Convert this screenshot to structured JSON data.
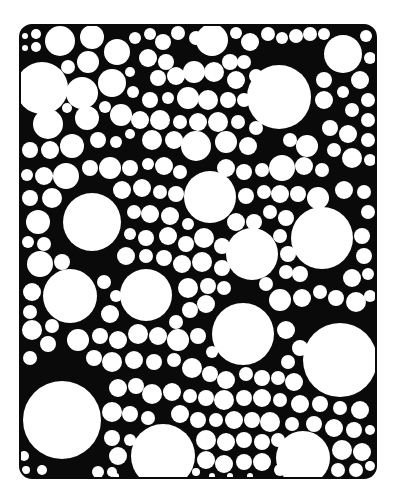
{
  "artwork": {
    "type": "circle-pattern-coloring-page",
    "frame": {
      "x": 20,
      "y": 25,
      "width": 356,
      "height": 453,
      "radius": 12
    },
    "colors": {
      "background": "#ffffff",
      "ink": "#0a0a0a",
      "fill": "#ffffff"
    },
    "circles": [
      [
        25,
        36,
        4
      ],
      [
        36,
        34,
        6
      ],
      [
        25,
        48,
        4
      ],
      [
        36,
        47,
        6
      ],
      [
        60,
        41,
        16
      ],
      [
        92,
        37,
        13
      ],
      [
        117,
        52,
        14
      ],
      [
        135,
        38,
        7
      ],
      [
        150,
        34,
        7
      ],
      [
        163,
        42,
        9
      ],
      [
        178,
        33,
        8
      ],
      [
        196,
        38,
        8
      ],
      [
        212,
        40,
        17
      ],
      [
        236,
        33,
        7
      ],
      [
        250,
        42,
        10
      ],
      [
        268,
        34,
        8
      ],
      [
        282,
        38,
        7
      ],
      [
        296,
        36,
        8
      ],
      [
        310,
        34,
        8
      ],
      [
        324,
        34,
        7
      ],
      [
        343,
        54,
        20
      ],
      [
        366,
        36,
        7
      ],
      [
        370,
        58,
        7
      ],
      [
        42,
        88,
        27
      ],
      [
        68,
        67,
        8
      ],
      [
        88,
        62,
        12
      ],
      [
        82,
        93,
        17
      ],
      [
        112,
        83,
        15
      ],
      [
        130,
        72,
        6
      ],
      [
        133,
        92,
        7
      ],
      [
        67,
        108,
        6
      ],
      [
        87,
        118,
        13
      ],
      [
        105,
        107,
        7
      ],
      [
        121,
        115,
        12
      ],
      [
        48,
        124,
        16
      ],
      [
        148,
        58,
        10
      ],
      [
        166,
        62,
        9
      ],
      [
        158,
        78,
        9
      ],
      [
        176,
        76,
        10
      ],
      [
        194,
        72,
        12
      ],
      [
        214,
        72,
        11
      ],
      [
        230,
        62,
        9
      ],
      [
        244,
        62,
        8
      ],
      [
        236,
        80,
        10
      ],
      [
        256,
        76,
        8
      ],
      [
        279,
        97,
        33
      ],
      [
        324,
        80,
        9
      ],
      [
        324,
        100,
        10
      ],
      [
        343,
        92,
        7
      ],
      [
        360,
        80,
        10
      ],
      [
        368,
        100,
        8
      ],
      [
        352,
        110,
        8
      ],
      [
        368,
        120,
        8
      ],
      [
        150,
        100,
        9
      ],
      [
        168,
        98,
        7
      ],
      [
        188,
        98,
        12
      ],
      [
        208,
        100,
        11
      ],
      [
        228,
        100,
        9
      ],
      [
        244,
        100,
        8
      ],
      [
        140,
        120,
        10
      ],
      [
        160,
        120,
        11
      ],
      [
        180,
        122,
        8
      ],
      [
        198,
        122,
        10
      ],
      [
        218,
        122,
        11
      ],
      [
        238,
        122,
        8
      ],
      [
        256,
        128,
        8
      ],
      [
        152,
        140,
        11
      ],
      [
        174,
        140,
        10
      ],
      [
        196,
        146,
        16
      ],
      [
        226,
        142,
        12
      ],
      [
        248,
        146,
        10
      ],
      [
        30,
        150,
        9
      ],
      [
        50,
        150,
        10
      ],
      [
        72,
        146,
        13
      ],
      [
        98,
        140,
        9
      ],
      [
        116,
        142,
        7
      ],
      [
        130,
        134,
        6
      ],
      [
        290,
        140,
        8
      ],
      [
        307,
        146,
        12
      ],
      [
        330,
        128,
        9
      ],
      [
        348,
        134,
        10
      ],
      [
        368,
        140,
        8
      ],
      [
        334,
        150,
        8
      ],
      [
        352,
        158,
        11
      ],
      [
        370,
        160,
        7
      ],
      [
        304,
        166,
        10
      ],
      [
        322,
        170,
        8
      ],
      [
        282,
        168,
        14
      ],
      [
        27,
        175,
        7
      ],
      [
        44,
        176,
        10
      ],
      [
        66,
        176,
        14
      ],
      [
        90,
        168,
        9
      ],
      [
        110,
        168,
        12
      ],
      [
        130,
        168,
        9
      ],
      [
        148,
        164,
        7
      ],
      [
        164,
        166,
        10
      ],
      [
        180,
        172,
        8
      ],
      [
        226,
        168,
        10
      ],
      [
        244,
        172,
        9
      ],
      [
        262,
        170,
        8
      ],
      [
        30,
        198,
        9
      ],
      [
        52,
        198,
        11
      ],
      [
        122,
        190,
        10
      ],
      [
        142,
        188,
        10
      ],
      [
        160,
        192,
        8
      ],
      [
        176,
        194,
        9
      ],
      [
        246,
        196,
        9
      ],
      [
        264,
        192,
        8
      ],
      [
        280,
        194,
        10
      ],
      [
        298,
        194,
        9
      ],
      [
        318,
        198,
        12
      ],
      [
        344,
        190,
        10
      ],
      [
        364,
        192,
        8
      ],
      [
        368,
        212,
        8
      ],
      [
        92,
        222,
        30
      ],
      [
        210,
        197,
        27
      ],
      [
        38,
        222,
        13
      ],
      [
        28,
        242,
        7
      ],
      [
        44,
        244,
        8
      ],
      [
        134,
        212,
        8
      ],
      [
        150,
        214,
        10
      ],
      [
        170,
        216,
        10
      ],
      [
        188,
        224,
        7
      ],
      [
        236,
        222,
        10
      ],
      [
        254,
        222,
        9
      ],
      [
        270,
        212,
        8
      ],
      [
        286,
        218,
        9
      ],
      [
        322,
        238,
        32
      ],
      [
        362,
        236,
        9
      ],
      [
        364,
        256,
        9
      ],
      [
        252,
        254,
        27
      ],
      [
        168,
        236,
        10
      ],
      [
        186,
        244,
        9
      ],
      [
        204,
        238,
        11
      ],
      [
        222,
        246,
        9
      ],
      [
        146,
        238,
        9
      ],
      [
        130,
        234,
        7
      ],
      [
        280,
        236,
        8
      ],
      [
        288,
        254,
        9
      ],
      [
        40,
        264,
        14
      ],
      [
        62,
        262,
        9
      ],
      [
        126,
        256,
        10
      ],
      [
        146,
        256,
        8
      ],
      [
        164,
        258,
        9
      ],
      [
        182,
        264,
        10
      ],
      [
        202,
        262,
        11
      ],
      [
        222,
        268,
        9
      ],
      [
        286,
        272,
        8
      ],
      [
        300,
        274,
        9
      ],
      [
        352,
        278,
        10
      ],
      [
        368,
        274,
        7
      ],
      [
        146,
        295,
        27
      ],
      [
        70,
        296,
        28
      ],
      [
        32,
        292,
        10
      ],
      [
        30,
        312,
        8
      ],
      [
        104,
        282,
        8
      ],
      [
        116,
        296,
        7
      ],
      [
        110,
        314,
        10
      ],
      [
        188,
        288,
        11
      ],
      [
        208,
        286,
        9
      ],
      [
        224,
        288,
        8
      ],
      [
        206,
        304,
        10
      ],
      [
        190,
        310,
        9
      ],
      [
        176,
        322,
        8
      ],
      [
        280,
        300,
        12
      ],
      [
        302,
        298,
        10
      ],
      [
        320,
        292,
        8
      ],
      [
        336,
        298,
        9
      ],
      [
        356,
        302,
        11
      ],
      [
        370,
        296,
        7
      ],
      [
        266,
        284,
        8
      ],
      [
        243,
        334,
        32
      ],
      [
        340,
        360,
        38
      ],
      [
        32,
        330,
        11
      ],
      [
        52,
        326,
        8
      ],
      [
        48,
        344,
        9
      ],
      [
        78,
        340,
        12
      ],
      [
        100,
        336,
        9
      ],
      [
        118,
        340,
        10
      ],
      [
        138,
        334,
        11
      ],
      [
        158,
        336,
        10
      ],
      [
        178,
        340,
        12
      ],
      [
        198,
        336,
        9
      ],
      [
        212,
        352,
        7
      ],
      [
        286,
        330,
        10
      ],
      [
        300,
        348,
        9
      ],
      [
        288,
        362,
        8
      ],
      [
        278,
        378,
        8
      ],
      [
        294,
        382,
        10
      ],
      [
        30,
        358,
        8
      ],
      [
        94,
        358,
        9
      ],
      [
        112,
        362,
        11
      ],
      [
        134,
        360,
        10
      ],
      [
        154,
        362,
        9
      ],
      [
        174,
        360,
        8
      ],
      [
        192,
        368,
        11
      ],
      [
        210,
        374,
        9
      ],
      [
        226,
        380,
        10
      ],
      [
        246,
        374,
        8
      ],
      [
        262,
        378,
        9
      ],
      [
        62,
        420,
        40
      ],
      [
        118,
        388,
        10
      ],
      [
        136,
        386,
        9
      ],
      [
        152,
        394,
        11
      ],
      [
        172,
        392,
        10
      ],
      [
        190,
        396,
        8
      ],
      [
        206,
        398,
        9
      ],
      [
        224,
        400,
        11
      ],
      [
        244,
        398,
        9
      ],
      [
        262,
        398,
        10
      ],
      [
        280,
        400,
        8
      ],
      [
        300,
        404,
        10
      ],
      [
        320,
        404,
        9
      ],
      [
        340,
        408,
        8
      ],
      [
        360,
        410,
        10
      ],
      [
        112,
        412,
        11
      ],
      [
        130,
        414,
        9
      ],
      [
        148,
        418,
        8
      ],
      [
        180,
        414,
        10
      ],
      [
        198,
        420,
        9
      ],
      [
        216,
        420,
        8
      ],
      [
        234,
        420,
        10
      ],
      [
        252,
        420,
        9
      ],
      [
        270,
        422,
        11
      ],
      [
        292,
        424,
        8
      ],
      [
        314,
        424,
        9
      ],
      [
        334,
        428,
        10
      ],
      [
        354,
        430,
        9
      ],
      [
        370,
        430,
        6
      ],
      [
        163,
        456,
        33
      ],
      [
        303,
        458,
        28
      ],
      [
        112,
        438,
        9
      ],
      [
        118,
        456,
        10
      ],
      [
        112,
        472,
        6
      ],
      [
        130,
        440,
        7
      ],
      [
        206,
        440,
        11
      ],
      [
        226,
        442,
        10
      ],
      [
        244,
        440,
        9
      ],
      [
        262,
        442,
        9
      ],
      [
        278,
        440,
        8
      ],
      [
        342,
        450,
        11
      ],
      [
        362,
        452,
        10
      ],
      [
        338,
        470,
        8
      ],
      [
        356,
        470,
        8
      ],
      [
        370,
        466,
        6
      ],
      [
        206,
        460,
        10
      ],
      [
        224,
        464,
        10
      ],
      [
        244,
        462,
        9
      ],
      [
        262,
        462,
        10
      ],
      [
        280,
        470,
        7
      ],
      [
        212,
        476,
        4
      ],
      [
        230,
        476,
        4
      ],
      [
        250,
        476,
        4
      ],
      [
        24,
        456,
        6
      ],
      [
        26,
        470,
        5
      ],
      [
        42,
        470,
        6
      ],
      [
        98,
        472,
        7
      ],
      [
        116,
        476,
        4
      ],
      [
        196,
        472,
        5
      ]
    ]
  }
}
